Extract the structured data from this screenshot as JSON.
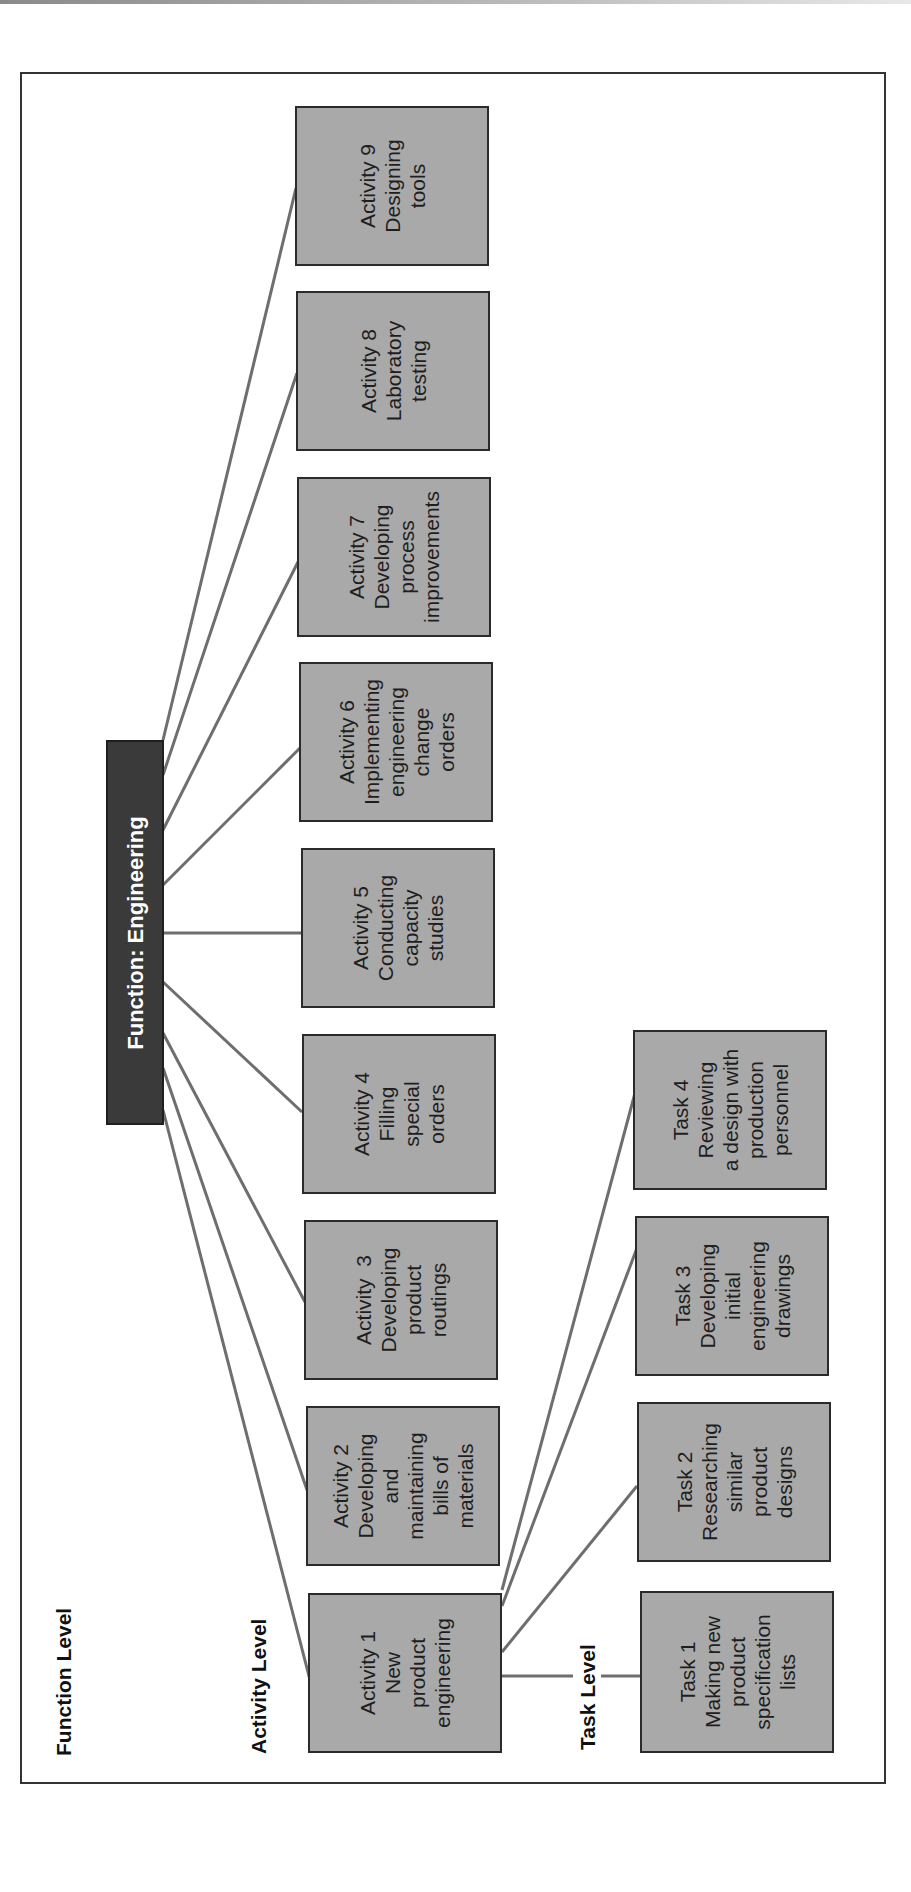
{
  "diagram": {
    "type": "hierarchy",
    "orientation": "rotated -90deg",
    "colors": {
      "box_fill": "#a9a9a9",
      "function_fill": "#3a3a3a",
      "connector": "#6e6e6e",
      "border": "#2b2b2b"
    }
  },
  "levels": {
    "function": "Function Level",
    "activity": "Activity Level",
    "task": "Task Level"
  },
  "function": {
    "label": "Function: Engineering"
  },
  "activities": [
    {
      "title": "Activity 1",
      "lines": [
        "New",
        "product",
        "engineering"
      ]
    },
    {
      "title": "Activity 2",
      "lines": [
        "Developing",
        "and",
        "maintaining",
        "bills of",
        "materials"
      ]
    },
    {
      "title": "Activity  3",
      "lines": [
        "Developing",
        "product",
        "routings"
      ]
    },
    {
      "title": "Activity 4",
      "lines": [
        "Filling",
        "special",
        "orders"
      ]
    },
    {
      "title": "Activity 5",
      "lines": [
        "Conducting",
        "capacity",
        "studies"
      ]
    },
    {
      "title": "Activity 6",
      "lines": [
        "Implementing",
        "engineering",
        "change",
        "orders"
      ]
    },
    {
      "title": "Activity 7",
      "lines": [
        "Developing",
        "process",
        "improvements"
      ]
    },
    {
      "title": "Activity 8",
      "lines": [
        "Laboratory",
        "testing"
      ]
    },
    {
      "title": "Activity 9",
      "lines": [
        "Designing",
        "tools"
      ]
    }
  ],
  "tasks": [
    {
      "title": "Task 1",
      "lines": [
        "Making new",
        "product",
        "specification",
        "lists"
      ]
    },
    {
      "title": "Task 2",
      "lines": [
        "Researching",
        "similar",
        "product",
        "designs"
      ]
    },
    {
      "title": "Task 3",
      "lines": [
        "Developing",
        "initial",
        "engineering",
        "drawings"
      ]
    },
    {
      "title": "Task 4",
      "lines": [
        "Reviewing",
        "a design with",
        "production",
        "personnel"
      ]
    }
  ]
}
